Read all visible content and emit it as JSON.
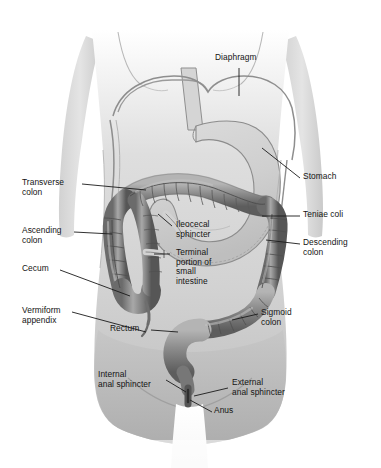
{
  "figure": {
    "view": "anterior view of human torso",
    "background_color": "#ffffff",
    "body_fill": "#d8d8d8",
    "organ_colors": {
      "stomach": "#c9c9c9",
      "colon": "#8a8a8a",
      "colon_highlight": "#bdbdbd",
      "colon_shadow": "#5e5e5e",
      "outline": "#4a4a4a",
      "leader_line": "#1a1a1a"
    }
  },
  "labels": {
    "diaphragm": "Diaphragm",
    "stomach": "Stomach",
    "teniae_coli": "Teniae coli",
    "descending_colon": "Descending\ncolon",
    "sigmoid_colon": "Sigmoid\ncolon",
    "transverse_colon": "Transverse\ncolon",
    "ascending_colon": "Ascending\ncolon",
    "cecum": "Cecum",
    "vermiform_appendix": "Vermiform\nappendix",
    "ileocecal_sphincter": "Ileocecal\nsphincter",
    "terminal_portion_small_intestine": "Terminal\nportion of\nsmall\nintestine",
    "rectum": "Rectum",
    "internal_anal_sphincter": "Internal\nanal sphincter",
    "external_anal_sphincter": "External\nanal sphincter",
    "anus": "Anus"
  }
}
